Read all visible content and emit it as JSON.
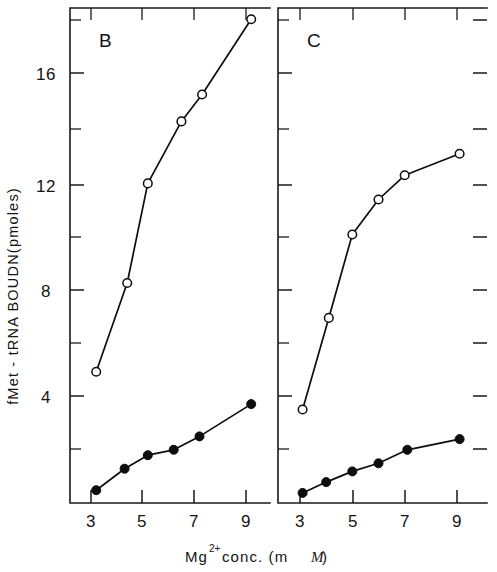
{
  "figure": {
    "background_color": "#ffffff",
    "ink_color": "#111111",
    "xlabel_parts": {
      "element": "Mg",
      "charge": "2+",
      "middle": " conc. (m",
      "italic_unit": "M",
      "close": ")"
    },
    "xlabel_full": "Mg2+ conc. (mM)",
    "ylabel": "fMet - tRNA BOUDN(pmoles)"
  },
  "chart_data": [
    {
      "type": "line",
      "panel": "B",
      "title": "B",
      "xlabel": "Mg2+ conc. (mM)",
      "ylabel": "fMet - tRNA BOUDN(pmoles)",
      "xlim": [
        2.2,
        10.0
      ],
      "ylim": [
        0,
        18.6
      ],
      "xticks": [
        3,
        5,
        7,
        9
      ],
      "xtick_labels": [
        "3",
        "5",
        "7",
        "9"
      ],
      "yticks": [
        4,
        8,
        12,
        16
      ],
      "ytick_labels": [
        "4",
        "8",
        "12",
        "16"
      ],
      "yticks_minor": [
        2,
        6,
        10,
        14,
        18
      ],
      "xticks_minor": [
        4,
        6,
        8,
        10
      ],
      "grid": false,
      "legend": null,
      "series": [
        {
          "name": "open-circle-series",
          "marker": "open-circle",
          "x": [
            3.2,
            4.4,
            5.2,
            6.5,
            7.3,
            9.2
          ],
          "values": [
            4.9,
            8.2,
            11.9,
            14.2,
            15.2,
            18.0
          ]
        },
        {
          "name": "filled-circle-series",
          "marker": "filled-circle",
          "x": [
            3.2,
            4.3,
            5.2,
            6.2,
            7.2,
            9.2
          ],
          "values": [
            0.5,
            1.3,
            1.8,
            2.0,
            2.5,
            3.7
          ]
        }
      ]
    },
    {
      "type": "line",
      "panel": "C",
      "title": "C",
      "xlabel": "Mg2+ conc. (mM)",
      "ylabel": "fMet - tRNA BOUDN(pmoles)",
      "xlim": [
        2.2,
        10.0
      ],
      "ylim": [
        0,
        18.6
      ],
      "xticks": [
        3,
        5,
        7,
        9
      ],
      "xtick_labels": [
        "3",
        "5",
        "7",
        "9"
      ],
      "yticks": [
        4,
        8,
        12,
        16
      ],
      "ytick_labels": [],
      "yticks_minor": [
        2,
        6,
        10,
        14,
        18
      ],
      "xticks_minor": [
        4,
        6,
        8,
        10
      ],
      "grid": false,
      "legend": null,
      "series": [
        {
          "name": "open-circle-series",
          "marker": "open-circle",
          "x": [
            3.1,
            4.1,
            5.0,
            6.0,
            7.0,
            9.1
          ],
          "values": [
            3.5,
            6.9,
            10.0,
            11.3,
            12.2,
            13.0
          ]
        },
        {
          "name": "filled-circle-series",
          "marker": "filled-circle",
          "x": [
            3.1,
            4.0,
            5.0,
            6.0,
            7.1,
            9.1
          ],
          "values": [
            0.4,
            0.8,
            1.2,
            1.5,
            2.0,
            2.4
          ]
        }
      ]
    }
  ]
}
